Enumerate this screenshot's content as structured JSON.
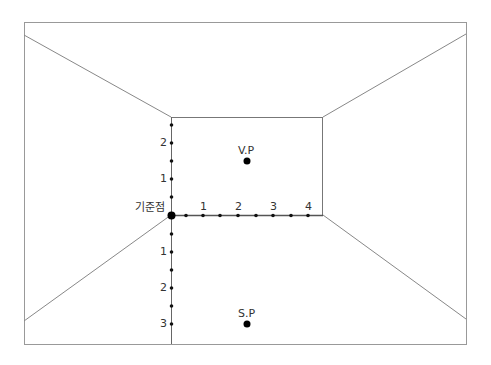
{
  "diagram": {
    "origin_label": "기준점",
    "vanishing_point_label": "V.P",
    "station_point_label": "S.P",
    "horizontal_ticks": [
      "1",
      "2",
      "3",
      "4"
    ],
    "vertical_up_ticks": [
      "1",
      "2"
    ],
    "vertical_down_ticks": [
      "1",
      "2",
      "3"
    ],
    "colors": {
      "line": "#888888",
      "axis": "#555555",
      "dot": "#111111",
      "text": "#333333"
    }
  }
}
